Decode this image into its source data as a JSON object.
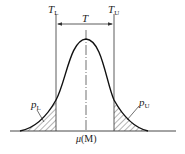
{
  "diagram": {
    "type": "normal-distribution-tolerance",
    "labels": {
      "lower_limit": {
        "symbol": "T",
        "subscript": "L"
      },
      "upper_limit": {
        "symbol": "T",
        "subscript": "U"
      },
      "tolerance": "T",
      "lower_tail": {
        "symbol": "p",
        "subscript": "L"
      },
      "upper_tail": {
        "symbol": "p",
        "subscript": "U"
      },
      "center": {
        "symbol": "μ",
        "paren": "(M)"
      }
    },
    "colors": {
      "curve": "#111111",
      "lines": "#333333",
      "hatch": "#444444",
      "background": "#ffffff"
    }
  }
}
